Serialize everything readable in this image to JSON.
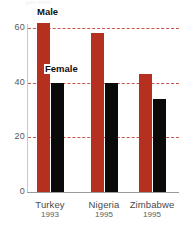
{
  "crop_title": "per cent",
  "chart_data": {
    "type": "bar",
    "title": "",
    "subtitle": "",
    "xlabel": "",
    "ylabel": "",
    "categories": [
      "Turkey",
      "Nigeria",
      "Zimbabwe"
    ],
    "category_years": [
      "1993",
      "1995",
      "1995"
    ],
    "series": [
      {
        "name": "Male",
        "color": "#b5301e",
        "values": [
          62,
          58,
          43
        ]
      },
      {
        "name": "Female",
        "color": "#0a0a0a",
        "values": [
          40,
          40,
          34
        ]
      }
    ],
    "ylim": [
      0,
      65
    ],
    "yticks": [
      0,
      20,
      40,
      60
    ],
    "ytick_labels": [
      "0",
      "20",
      "40",
      "60"
    ],
    "gridlines": [
      20,
      40,
      60
    ],
    "grid": true,
    "grid_style": "dashed",
    "grid_color": "#c0392b",
    "legend": "inline-annotation",
    "legend_entries": [
      "Male",
      "Female"
    ],
    "background": "#ffffff"
  },
  "axis": {
    "ticks": [
      {
        "label": "60",
        "value": 60
      },
      {
        "label": "40",
        "value": 40
      },
      {
        "label": "20",
        "value": 20
      },
      {
        "label": "0",
        "value": 0
      }
    ]
  },
  "groups": [
    {
      "name": "Turkey",
      "year": "1993",
      "male": 62,
      "female": 40
    },
    {
      "name": "Nigeria",
      "year": "1995",
      "male": 58,
      "female": 40
    },
    {
      "name": "Zimbabwe",
      "year": "1995",
      "male": 43,
      "female": 34
    }
  ],
  "annotations": {
    "male_label": "Male",
    "female_label": "Female"
  },
  "colors": {
    "male": "#b5301e",
    "female": "#0a0a0a",
    "gridline": "#c0392b",
    "axis": "#9a9a9a",
    "tick_text": "#585858",
    "caption_text": "#4a4a4a",
    "background": "#ffffff"
  }
}
